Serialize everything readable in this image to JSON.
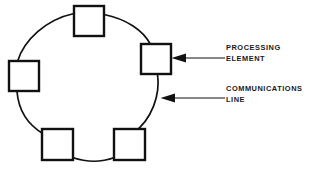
{
  "diagram": {
    "type": "ring-network-topology",
    "background_color": "#ffffff",
    "stroke_color": "#111111",
    "nodes": [
      {
        "id": "node-top",
        "name": "processing-element-top",
        "x": 74,
        "y": 6,
        "size": 30
      },
      {
        "id": "node-right",
        "name": "processing-element-right",
        "x": 141,
        "y": 44,
        "size": 30
      },
      {
        "id": "node-left",
        "name": "processing-element-left",
        "x": 9,
        "y": 61,
        "size": 30
      },
      {
        "id": "node-bottom-left",
        "name": "processing-element-bottom-left",
        "x": 42,
        "y": 129,
        "size": 31
      },
      {
        "id": "node-bottom-right",
        "name": "processing-element-bottom-right",
        "x": 114,
        "y": 129,
        "size": 31
      }
    ],
    "ring": {
      "name": "communications-line-ring",
      "center_x": 85,
      "center_y": 85,
      "radius_x": 76,
      "radius_y": 78
    },
    "annotations": [
      {
        "id": "annotation-processing-element",
        "lines": [
          "PROCESSING",
          "ELEMENT"
        ],
        "arrow": {
          "from_x": 225,
          "to_x": 172,
          "y": 58,
          "direction": "left"
        },
        "target": "node-right"
      },
      {
        "id": "annotation-communications-line",
        "lines": [
          "COMMUNICATIONS",
          "LINE"
        ],
        "arrow": {
          "from_x": 225,
          "to_x": 161,
          "y": 98,
          "direction": "left"
        },
        "target": "communications-line-ring"
      }
    ]
  },
  "labels": {
    "processing_element": {
      "line1": "PROCESSING",
      "line2": "ELEMENT"
    },
    "communications_line": {
      "line1": "COMMUNICATIONS",
      "line2": "LINE"
    }
  }
}
